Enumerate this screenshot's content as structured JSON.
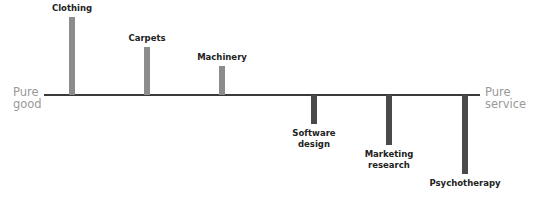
{
  "diagram": {
    "left_end": {
      "line1": "Pure",
      "line2": "good"
    },
    "right_end": {
      "line1": "Pure",
      "line2": "service"
    },
    "items": [
      {
        "label1": "Clothing",
        "label2": "",
        "side": "good",
        "x": 72,
        "extent": 78
      },
      {
        "label1": "Carpets",
        "label2": "",
        "side": "good",
        "x": 147,
        "extent": 48
      },
      {
        "label1": "Machinery",
        "label2": "",
        "side": "good",
        "x": 222,
        "extent": 29
      },
      {
        "label1": "Software",
        "label2": "design",
        "side": "service",
        "x": 314,
        "extent": 29
      },
      {
        "label1": "Marketing",
        "label2": "research",
        "side": "service",
        "x": 389,
        "extent": 50
      },
      {
        "label1": "Psychotherapy",
        "label2": "",
        "side": "service",
        "x": 465,
        "extent": 79
      }
    ],
    "colors": {
      "good_bar": "#8c8c8c",
      "service_bar": "#4a4a4a",
      "axis": "#3a3a3a",
      "end_label": "#9a9a9a"
    }
  },
  "chart_data": {
    "type": "bar",
    "title": "",
    "categories": [
      "Clothing",
      "Carpets",
      "Machinery",
      "Software design",
      "Marketing research",
      "Psychotherapy"
    ],
    "values": [
      78,
      48,
      29,
      -29,
      -50,
      -79
    ],
    "xlabel": "Pure good → Pure service",
    "ylabel": "",
    "grid": false,
    "legend": "none"
  }
}
